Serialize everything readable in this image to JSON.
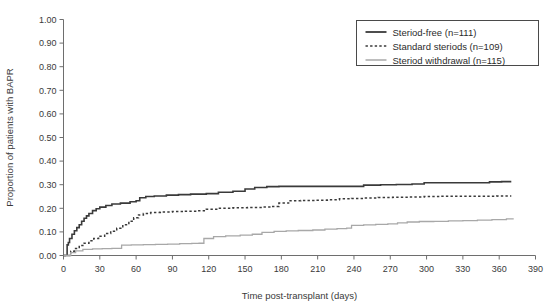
{
  "chart_data": {
    "type": "line",
    "title": "",
    "subtitle": "",
    "xlabel": "Time post-transplant (days)",
    "ylabel": "Proportion of patients with BAPR",
    "xlim": [
      0,
      390
    ],
    "ylim": [
      0,
      1.0
    ],
    "xticks": [
      0,
      30,
      60,
      90,
      120,
      150,
      180,
      210,
      240,
      270,
      300,
      330,
      360,
      390
    ],
    "xtick_labels": [
      "0",
      "30",
      "60",
      "90",
      "120",
      "150",
      "180",
      "210",
      "240",
      "270",
      "300",
      "330",
      "360",
      "390"
    ],
    "yticks": [
      0.0,
      0.1,
      0.2,
      0.3,
      0.4,
      0.5,
      0.6,
      0.7,
      0.8,
      0.9,
      1.0
    ],
    "ytick_labels": [
      "0.00",
      "0.10",
      "0.20",
      "0.30",
      "0.40",
      "0.50",
      "0.60",
      "0.70",
      "0.80",
      "0.90",
      "1.00"
    ],
    "grid": false,
    "legend_position": "top-right",
    "step_plot": true,
    "series": [
      {
        "name": "Steriod-free (n=111)",
        "n": 111,
        "style": "solid",
        "color": "#3a3a3a",
        "width": 1.6,
        "final_value": 0.31,
        "points": [
          [
            0,
            0.0
          ],
          [
            2,
            0.0
          ],
          [
            3,
            0.045
          ],
          [
            4,
            0.055
          ],
          [
            5,
            0.072
          ],
          [
            7,
            0.09
          ],
          [
            9,
            0.105
          ],
          [
            11,
            0.118
          ],
          [
            13,
            0.13
          ],
          [
            15,
            0.145
          ],
          [
            17,
            0.158
          ],
          [
            19,
            0.168
          ],
          [
            21,
            0.178
          ],
          [
            24,
            0.19
          ],
          [
            27,
            0.198
          ],
          [
            30,
            0.205
          ],
          [
            35,
            0.212
          ],
          [
            40,
            0.218
          ],
          [
            47,
            0.222
          ],
          [
            55,
            0.228
          ],
          [
            60,
            0.232
          ],
          [
            63,
            0.245
          ],
          [
            68,
            0.25
          ],
          [
            75,
            0.252
          ],
          [
            85,
            0.256
          ],
          [
            95,
            0.258
          ],
          [
            105,
            0.26
          ],
          [
            118,
            0.262
          ],
          [
            128,
            0.268
          ],
          [
            140,
            0.272
          ],
          [
            150,
            0.282
          ],
          [
            158,
            0.288
          ],
          [
            168,
            0.292
          ],
          [
            178,
            0.293
          ],
          [
            190,
            0.293
          ],
          [
            205,
            0.293
          ],
          [
            222,
            0.293
          ],
          [
            238,
            0.293
          ],
          [
            248,
            0.298
          ],
          [
            262,
            0.3
          ],
          [
            275,
            0.301
          ],
          [
            288,
            0.303
          ],
          [
            298,
            0.308
          ],
          [
            312,
            0.308
          ],
          [
            326,
            0.308
          ],
          [
            340,
            0.308
          ],
          [
            352,
            0.312
          ],
          [
            362,
            0.313
          ],
          [
            370,
            0.313
          ]
        ]
      },
      {
        "name": "Standard steriods (n=109)",
        "n": 109,
        "style": "dotted",
        "color": "#3a3a3a",
        "width": 1.5,
        "final_value": 0.25,
        "points": [
          [
            0,
            0.0
          ],
          [
            4,
            0.0
          ],
          [
            6,
            0.018
          ],
          [
            9,
            0.03
          ],
          [
            13,
            0.042
          ],
          [
            17,
            0.052
          ],
          [
            21,
            0.062
          ],
          [
            25,
            0.072
          ],
          [
            29,
            0.082
          ],
          [
            34,
            0.093
          ],
          [
            39,
            0.103
          ],
          [
            44,
            0.115
          ],
          [
            49,
            0.13
          ],
          [
            54,
            0.145
          ],
          [
            58,
            0.16
          ],
          [
            62,
            0.172
          ],
          [
            66,
            0.178
          ],
          [
            72,
            0.182
          ],
          [
            80,
            0.184
          ],
          [
            90,
            0.186
          ],
          [
            100,
            0.188
          ],
          [
            110,
            0.19
          ],
          [
            118,
            0.196
          ],
          [
            128,
            0.2
          ],
          [
            140,
            0.202
          ],
          [
            152,
            0.203
          ],
          [
            164,
            0.205
          ],
          [
            172,
            0.208
          ],
          [
            178,
            0.222
          ],
          [
            186,
            0.232
          ],
          [
            196,
            0.233
          ],
          [
            208,
            0.234
          ],
          [
            218,
            0.236
          ],
          [
            228,
            0.24
          ],
          [
            238,
            0.242
          ],
          [
            248,
            0.244
          ],
          [
            260,
            0.246
          ],
          [
            272,
            0.247
          ],
          [
            285,
            0.248
          ],
          [
            298,
            0.25
          ],
          [
            312,
            0.251
          ],
          [
            328,
            0.251
          ],
          [
            344,
            0.251
          ],
          [
            358,
            0.252
          ],
          [
            370,
            0.252
          ]
        ]
      },
      {
        "name": "Steriod withdrawal (n=115)",
        "n": 115,
        "style": "solid",
        "color": "#a8a8a8",
        "width": 1.3,
        "final_value": 0.155,
        "points": [
          [
            0,
            0.0
          ],
          [
            4,
            0.0
          ],
          [
            6,
            0.012
          ],
          [
            10,
            0.02
          ],
          [
            16,
            0.026
          ],
          [
            24,
            0.028
          ],
          [
            32,
            0.029
          ],
          [
            40,
            0.03
          ],
          [
            46,
            0.03
          ],
          [
            48,
            0.044
          ],
          [
            56,
            0.045
          ],
          [
            66,
            0.046
          ],
          [
            76,
            0.047
          ],
          [
            86,
            0.048
          ],
          [
            96,
            0.05
          ],
          [
            106,
            0.051
          ],
          [
            112,
            0.052
          ],
          [
            116,
            0.072
          ],
          [
            124,
            0.08
          ],
          [
            134,
            0.083
          ],
          [
            146,
            0.086
          ],
          [
            156,
            0.09
          ],
          [
            164,
            0.098
          ],
          [
            174,
            0.102
          ],
          [
            184,
            0.104
          ],
          [
            194,
            0.106
          ],
          [
            206,
            0.108
          ],
          [
            216,
            0.112
          ],
          [
            226,
            0.114
          ],
          [
            234,
            0.116
          ],
          [
            238,
            0.128
          ],
          [
            248,
            0.13
          ],
          [
            258,
            0.132
          ],
          [
            268,
            0.134
          ],
          [
            276,
            0.138
          ],
          [
            284,
            0.142
          ],
          [
            294,
            0.144
          ],
          [
            306,
            0.145
          ],
          [
            318,
            0.147
          ],
          [
            330,
            0.148
          ],
          [
            342,
            0.15
          ],
          [
            354,
            0.152
          ],
          [
            366,
            0.155
          ],
          [
            372,
            0.155
          ]
        ]
      }
    ]
  },
  "legend": {
    "entries": [
      {
        "label": "Steriod-free (n=111)",
        "marker": "solid-line-dark"
      },
      {
        "label": "Standard steriods (n=109)",
        "marker": "dotted-line-dark"
      },
      {
        "label": "Steriod withdrawal (n=115)",
        "marker": "solid-line-gray"
      }
    ]
  },
  "colors": {
    "steroid_free": "#3a3a3a",
    "standard_steroids": "#3a3a3a",
    "steroid_withdrawal": "#a8a8a8",
    "axis": "#6e6e6e",
    "background": "#ffffff"
  }
}
